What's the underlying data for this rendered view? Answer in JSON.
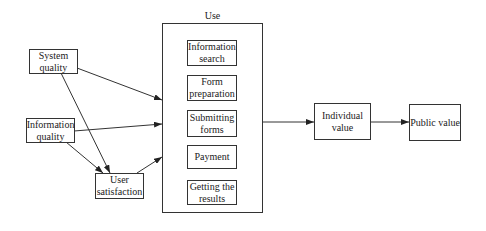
{
  "diagram": {
    "nodes": {
      "system_quality": {
        "line1": "System",
        "line2": "quality"
      },
      "information_quality": {
        "line1": "Information",
        "line2": "quality"
      },
      "user_satisfaction": {
        "line1": "User",
        "line2": "satisfaction"
      },
      "use": {
        "title": "Use",
        "activities": [
          {
            "line1": "Information",
            "line2": "search"
          },
          {
            "line1": "Form",
            "line2": "preparation"
          },
          {
            "line1": "Submitting",
            "line2": "forms"
          },
          {
            "line1": "Payment",
            "line2": ""
          },
          {
            "line1": "Getting the",
            "line2": "results"
          }
        ]
      },
      "individual_value": {
        "line1": "Individual",
        "line2": "value"
      },
      "public_value": {
        "line1": "Public value",
        "line2": ""
      }
    },
    "edges": [
      {
        "from": "System quality",
        "to": "Use"
      },
      {
        "from": "System quality",
        "to": "User satisfaction"
      },
      {
        "from": "Information quality",
        "to": "Use"
      },
      {
        "from": "Information quality",
        "to": "User satisfaction"
      },
      {
        "from": "User satisfaction",
        "to": "Use"
      },
      {
        "from": "Use",
        "to": "Individual value"
      },
      {
        "from": "Individual value",
        "to": "Public value"
      }
    ],
    "colors": {
      "stroke": "#333333",
      "background": "#ffffff",
      "text": "#222222"
    }
  }
}
